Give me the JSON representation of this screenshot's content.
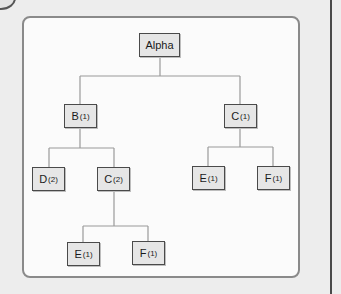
{
  "diagram": {
    "type": "tree",
    "root": {
      "id": "alpha",
      "label": "Alpha",
      "sub": "",
      "children": [
        {
          "id": "b1",
          "label": "B",
          "sub": "(1)",
          "children": [
            {
              "id": "d2",
              "label": "D",
              "sub": "(2)"
            },
            {
              "id": "c2",
              "label": "C",
              "sub": "(2)",
              "children": [
                {
                  "id": "e1a",
                  "label": "E",
                  "sub": "(1)"
                },
                {
                  "id": "f1a",
                  "label": "F",
                  "sub": "(1)"
                }
              ]
            }
          ]
        },
        {
          "id": "c1",
          "label": "C",
          "sub": "(1)",
          "children": [
            {
              "id": "e1b",
              "label": "E",
              "sub": "(1)"
            },
            {
              "id": "f1b",
              "label": "F",
              "sub": "(1)"
            }
          ]
        }
      ]
    },
    "nodes": {
      "alpha": {
        "label": "Alpha",
        "sub": ""
      },
      "b1": {
        "label": "B",
        "sub": "(1)"
      },
      "c1": {
        "label": "C",
        "sub": "(1)"
      },
      "d2": {
        "label": "D",
        "sub": "(2)"
      },
      "c2": {
        "label": "C",
        "sub": "(2)"
      },
      "e1b": {
        "label": "E",
        "sub": "(1)"
      },
      "f1b": {
        "label": "F",
        "sub": "(1)"
      },
      "e1a": {
        "label": "E",
        "sub": "(1)"
      },
      "f1a": {
        "label": "F",
        "sub": "(1)"
      }
    }
  },
  "colors": {
    "page_bg": "#ededed",
    "panel_bg": "#fbfbfb",
    "panel_border": "#8a8a8a",
    "node_fill": "#e6e6e6",
    "node_border": "#4a4a4a",
    "connector": "#9a9a9a"
  }
}
